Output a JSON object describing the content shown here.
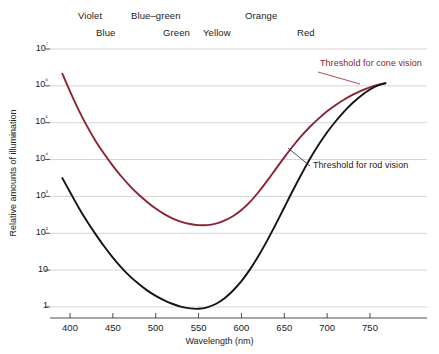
{
  "chart_data": {
    "type": "line",
    "title": "",
    "xlabel": "Wavelength (nm)",
    "ylabel": "Relative amounts of illumination",
    "xlim": [
      385,
      775
    ],
    "ylim": [
      -0.4,
      7
    ],
    "yscale": "log10",
    "grid": true,
    "legend_position": "inline-annotations",
    "xticks": [
      400,
      450,
      500,
      550,
      600,
      650,
      700,
      750
    ],
    "xticklabels": [
      "400",
      "450",
      "500",
      "550",
      "600",
      "650",
      "700",
      "750"
    ],
    "yticks": [
      0,
      1,
      2,
      3,
      4,
      5,
      6,
      7
    ],
    "yticklabels": [
      "1",
      "10",
      "10²",
      "10³",
      "10⁴",
      "10⁵",
      "10⁶",
      "10⁷"
    ],
    "series": [
      {
        "name": "Threshold for cone vision",
        "color": "#8B2332",
        "x": [
          391,
          400,
          410,
          420,
          430,
          440,
          450,
          460,
          470,
          480,
          490,
          500,
          510,
          520,
          530,
          540,
          550,
          560,
          570,
          580,
          590,
          600,
          610,
          620,
          630,
          640,
          650,
          660,
          670,
          680,
          690,
          700,
          710,
          720,
          730,
          740,
          750,
          760,
          768
        ],
        "y": [
          6.33,
          5.85,
          5.35,
          4.9,
          4.5,
          4.15,
          3.83,
          3.54,
          3.28,
          3.05,
          2.85,
          2.67,
          2.52,
          2.4,
          2.31,
          2.25,
          2.22,
          2.22,
          2.26,
          2.34,
          2.46,
          2.63,
          2.85,
          3.12,
          3.42,
          3.74,
          4.06,
          4.36,
          4.64,
          4.89,
          5.11,
          5.31,
          5.48,
          5.63,
          5.76,
          5.87,
          5.96,
          6.03,
          6.07
        ]
      },
      {
        "name": "Threshold for rod vision",
        "color": "#141414",
        "x": [
          391,
          400,
          410,
          420,
          430,
          440,
          450,
          460,
          470,
          480,
          490,
          500,
          510,
          520,
          530,
          540,
          550,
          560,
          570,
          580,
          590,
          600,
          610,
          620,
          630,
          640,
          650,
          660,
          670,
          680,
          690,
          700,
          710,
          720,
          730,
          740,
          750,
          760,
          768
        ],
        "y": [
          3.5,
          3.12,
          2.7,
          2.32,
          1.97,
          1.64,
          1.34,
          1.07,
          0.83,
          0.63,
          0.45,
          0.3,
          0.18,
          0.08,
          0.0,
          -0.04,
          -0.05,
          -0.01,
          0.08,
          0.23,
          0.44,
          0.7,
          1.02,
          1.39,
          1.8,
          2.24,
          2.7,
          3.16,
          3.6,
          4.02,
          4.4,
          4.74,
          5.04,
          5.31,
          5.54,
          5.74,
          5.9,
          6.02,
          6.07
        ]
      }
    ],
    "annotations": [
      {
        "name": "cone-annotation",
        "text": "Threshold for cone vision",
        "color": "#8B2332"
      },
      {
        "name": "rod-annotation",
        "text": "Threshold for rod vision",
        "color": "#1a1a1a"
      }
    ]
  },
  "spectrum_labels": {
    "row_top": [
      {
        "text": "Violet",
        "x": 78,
        "y": 10
      },
      {
        "text": "Blue–green",
        "x": 131,
        "y": 10
      },
      {
        "text": "Orange",
        "x": 245,
        "y": 10
      }
    ],
    "row_bottom": [
      {
        "text": "Blue",
        "x": 96,
        "y": 27
      },
      {
        "text": "Green",
        "x": 163,
        "y": 27
      },
      {
        "text": "Yellow",
        "x": 203,
        "y": 27
      },
      {
        "text": "Red",
        "x": 297,
        "y": 27
      }
    ]
  },
  "axes": {
    "ylabel": "Relative amounts of illumination",
    "xlabel": "Wavelength (nm)"
  },
  "colors": {
    "cone": "#8B2332",
    "rod": "#141414",
    "grid": "#c9c9c9",
    "axis": "#3a3a3a",
    "background": "#ffffff"
  }
}
